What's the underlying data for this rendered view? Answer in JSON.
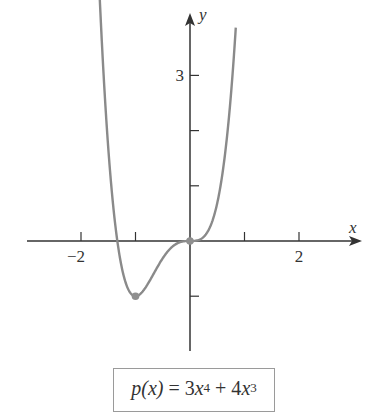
{
  "chart_data": {
    "type": "line",
    "function": "3*x^4 + 4*x^3",
    "xlabel": "x",
    "ylabel": "y",
    "xlim": [
      -2.9,
      3.3
    ],
    "ylim": [
      -2,
      4
    ],
    "grid": false,
    "legend": null,
    "x_ticks": [
      -2,
      -1,
      1,
      2
    ],
    "x_tick_labels": [
      {
        "value": -2,
        "label": "−2"
      },
      {
        "value": 2,
        "label": "2"
      }
    ],
    "y_ticks": [
      -1,
      1,
      2,
      3
    ],
    "y_tick_labels": [
      {
        "value": 3,
        "label": "3"
      }
    ],
    "curve_domain": [
      -1.66,
      0.84
    ],
    "series": [
      {
        "name": "p(x)",
        "x": [
          -1.66,
          -1.6,
          -1.5,
          -1.4,
          -1.333,
          -1.2,
          -1.1,
          -1.0,
          -0.9,
          -0.8,
          -0.7,
          -0.6,
          -0.5,
          -0.4,
          -0.3,
          -0.2,
          -0.1,
          0.0,
          0.1,
          0.2,
          0.3,
          0.4,
          0.5,
          0.6,
          0.7,
          0.8,
          0.84
        ],
        "y": [
          3.98,
          2.62,
          1.69,
          0.56,
          0.0,
          -0.69,
          -0.93,
          -1.0,
          -0.95,
          -0.82,
          -0.65,
          -0.48,
          -0.31,
          -0.18,
          -0.08,
          -0.027,
          -0.0037,
          0.0,
          0.0043,
          0.037,
          0.132,
          0.333,
          0.688,
          1.253,
          2.092,
          3.277,
          3.86
        ],
        "color": "#8a8a8a"
      }
    ],
    "highlighted_points": [
      {
        "x": -1,
        "y": -1,
        "label": "local minimum"
      },
      {
        "x": 0,
        "y": 0,
        "label": "inflection point"
      }
    ],
    "annotations": [
      "p(x) = 3x^4 + 4x^3"
    ]
  },
  "formula": {
    "lhs": "p(x)",
    "eq": " = 3",
    "t1_var": "x",
    "t1_exp": "4",
    "plus": " + 4",
    "t2_var": "x",
    "t2_exp": "3"
  },
  "colors": {
    "axis": "#333333",
    "curve": "#8a8a8a",
    "point": "#8f8f8f",
    "box_border": "#9a9a9a"
  }
}
